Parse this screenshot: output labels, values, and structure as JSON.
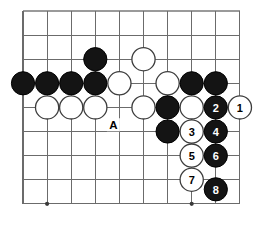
{
  "diagram": {
    "kind": "go-board-diagram",
    "title": "",
    "board": {
      "origin_x": 23,
      "origin_y": 11,
      "spacing": 24.1,
      "columns": 10,
      "rows": 9,
      "line_color": "#6b6b6b",
      "background_color": "#ffffff"
    },
    "star_points": [
      {
        "col": 1,
        "row": 8
      },
      {
        "col": 7,
        "row": 8
      }
    ],
    "colors": {
      "black_stone": "#141414",
      "white_stone": "#ffffff",
      "white_stone_outline": "#3d3d3d",
      "black_label_text": "#ffffff",
      "white_label_text": "#000000",
      "grid": "#6b6b6b",
      "star": "#3a3a3a"
    },
    "stones": [
      {
        "id": "b-e3",
        "color": "black",
        "col": 3,
        "row": 2,
        "label": ""
      },
      {
        "id": "w-g3",
        "color": "white",
        "col": 5,
        "row": 2,
        "label": ""
      },
      {
        "id": "b-a4",
        "color": "black",
        "col": 0,
        "row": 3,
        "label": ""
      },
      {
        "id": "b-b4",
        "color": "black",
        "col": 1,
        "row": 3,
        "label": ""
      },
      {
        "id": "b-c4",
        "color": "black",
        "col": 2,
        "row": 3,
        "label": ""
      },
      {
        "id": "b-d4",
        "color": "black",
        "col": 3,
        "row": 3,
        "label": ""
      },
      {
        "id": "w-e4",
        "color": "white",
        "col": 4,
        "row": 3,
        "label": ""
      },
      {
        "id": "w-g4",
        "color": "white",
        "col": 6,
        "row": 3,
        "label": ""
      },
      {
        "id": "b-h4",
        "color": "black",
        "col": 7,
        "row": 3,
        "label": ""
      },
      {
        "id": "b-i4",
        "color": "black",
        "col": 8,
        "row": 3,
        "label": ""
      },
      {
        "id": "w-b5",
        "color": "white",
        "col": 1,
        "row": 4,
        "label": ""
      },
      {
        "id": "w-c5",
        "color": "white",
        "col": 2,
        "row": 4,
        "label": ""
      },
      {
        "id": "w-d5",
        "color": "white",
        "col": 3,
        "row": 4,
        "label": ""
      },
      {
        "id": "w-f5",
        "color": "white",
        "col": 5,
        "row": 4,
        "label": ""
      },
      {
        "id": "b-g5",
        "color": "black",
        "col": 6,
        "row": 4,
        "label": ""
      },
      {
        "id": "w-h5",
        "color": "white",
        "col": 7,
        "row": 4,
        "label": ""
      },
      {
        "id": "b-i5",
        "color": "black",
        "col": 8,
        "row": 4,
        "label": "2"
      },
      {
        "id": "w-j5",
        "color": "white",
        "col": 9,
        "row": 4,
        "label": "1"
      },
      {
        "id": "b-g6",
        "color": "black",
        "col": 6,
        "row": 5,
        "label": ""
      },
      {
        "id": "w-h6",
        "color": "white",
        "col": 7,
        "row": 5,
        "label": "3"
      },
      {
        "id": "b-i6",
        "color": "black",
        "col": 8,
        "row": 5,
        "label": "4"
      },
      {
        "id": "w-h7",
        "color": "white",
        "col": 7,
        "row": 6,
        "label": "5"
      },
      {
        "id": "b-i7",
        "color": "black",
        "col": 8,
        "row": 6,
        "label": "6"
      },
      {
        "id": "w-h8",
        "color": "white",
        "col": 7,
        "row": 7,
        "label": "7"
      },
      {
        "id": "b-i9",
        "color": "black",
        "col": 8,
        "row": 7.4,
        "label": "8"
      }
    ],
    "point_labels": [
      {
        "id": "label-a",
        "text": "A",
        "col": 3.75,
        "row": 4.72
      }
    ]
  }
}
